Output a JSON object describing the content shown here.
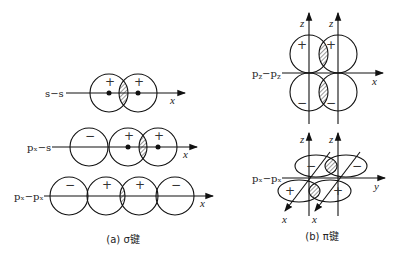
{
  "figure": {
    "panel_a": {
      "caption": "(a) σ键",
      "axis_label": "x",
      "rows": [
        {
          "label": "s−s",
          "signs": [
            "+",
            "+"
          ]
        },
        {
          "label": "pₓ−s",
          "signs": [
            "−",
            "+",
            "+"
          ]
        },
        {
          "label": "pₓ−pₓ",
          "signs": [
            "−",
            "+",
            "+",
            "−"
          ]
        }
      ]
    },
    "panel_b": {
      "caption": "(b) π键",
      "rows": [
        {
          "label": "p_z−p_z",
          "axis_labels": [
            "z",
            "z",
            "x"
          ],
          "signs": [
            "+",
            "+",
            "−",
            "−"
          ]
        },
        {
          "label": "pₓ−pₓ",
          "axis_labels": [
            "z",
            "z",
            "y",
            "x",
            "x"
          ],
          "signs": [
            "−",
            "−",
            "+",
            "+"
          ]
        }
      ]
    }
  }
}
